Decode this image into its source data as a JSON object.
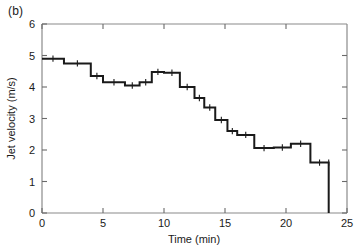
{
  "figure": {
    "panel_label": "(b)",
    "background": "#ffffff",
    "line_color": "#1a1a1a",
    "axis_color": "#888888"
  },
  "chart_data": {
    "type": "line",
    "title": "",
    "subtitle": "",
    "xlabel": "Time (min)",
    "ylabel": "Jet velocity (m/s)",
    "xlim": [
      0,
      25
    ],
    "ylim": [
      0,
      6
    ],
    "xticks": [
      0,
      5,
      10,
      15,
      20,
      25
    ],
    "xticklabels": [
      "0",
      "5",
      "10",
      "15",
      "20",
      "25"
    ],
    "yticks": [
      0,
      1,
      2,
      3,
      4,
      5,
      6
    ],
    "yticklabels": [
      "0",
      "1",
      "2",
      "3",
      "4",
      "5",
      "6"
    ],
    "grid": false,
    "legend": null,
    "drawstyle": "steps-post",
    "series": [
      {
        "name": "Jet velocity",
        "color": "#1a1a1a",
        "linewidth": 2,
        "x": [
          0.0,
          1.8,
          4.0,
          5.0,
          6.8,
          8.0,
          9.0,
          10.0,
          11.3,
          12.5,
          13.3,
          14.2,
          15.2,
          16.0,
          17.4,
          19.0,
          20.4,
          22.0,
          23.5,
          23.5
        ],
        "y": [
          4.9,
          4.75,
          4.35,
          4.15,
          4.05,
          4.15,
          4.48,
          4.45,
          4.0,
          3.65,
          3.35,
          2.95,
          2.6,
          2.48,
          2.06,
          2.08,
          2.2,
          1.6,
          1.6,
          0.0
        ]
      }
    ],
    "annotations": [
      {
        "text": "(b)",
        "position": "outside-top-left"
      }
    ]
  }
}
